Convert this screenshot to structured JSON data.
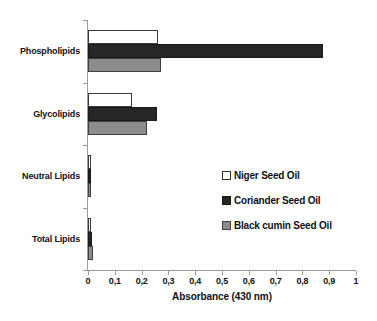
{
  "chart_data": {
    "type": "bar",
    "orientation": "horizontal",
    "title": "",
    "xlabel": "Absorbance (430 nm)",
    "ylabel": "",
    "xlim": [
      0,
      1
    ],
    "xticks": [
      "0",
      "0,1",
      "0,2",
      "0,3",
      "0,4",
      "0,5",
      "0,6",
      "0,7",
      "0,8",
      "0,9",
      "1"
    ],
    "xtick_values": [
      0,
      0.1,
      0.2,
      0.3,
      0.4,
      0.5,
      0.6,
      0.7,
      0.8,
      0.9,
      1.0
    ],
    "grid": false,
    "legend_position": "center-right",
    "categories": [
      "Phospholipids",
      "Glycolipids",
      "Neutral Lipids",
      "Total Lipids"
    ],
    "series": [
      {
        "name": "Niger Seed Oil",
        "color": "#ffffff",
        "edge_color": "#3a3a3a",
        "values": [
          0.26,
          0.165,
          0.006,
          0.005
        ]
      },
      {
        "name": "Coriander Seed Oil",
        "color": "#262626",
        "edge_color": "#1a1a1a",
        "values": [
          0.875,
          0.258,
          0.009,
          0.015
        ]
      },
      {
        "name": "Black cumin Seed Oil",
        "color": "#8c8c8c",
        "edge_color": "#3f3f3f",
        "values": [
          0.272,
          0.222,
          0.007,
          0.018
        ]
      }
    ]
  },
  "axis": {
    "x_title": "Absorbance (430 nm)"
  }
}
